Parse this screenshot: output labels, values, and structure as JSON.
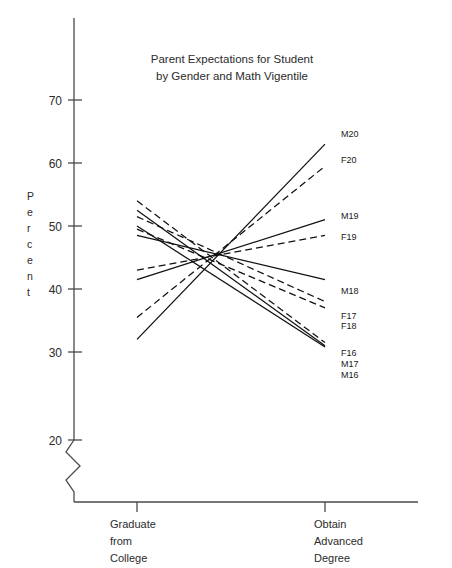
{
  "chart_data": {
    "type": "line",
    "title": "Parent Expectations for Student by Gender and Math Vigentile",
    "title_line1": "Parent Expectations for Student",
    "title_line2": "by Gender and Math Vigentile",
    "xlabel": "",
    "ylabel": "Percent",
    "categories": [
      "Graduate from College",
      "Obtain Advanced Degree"
    ],
    "category_lines": [
      [
        "Graduate",
        "from",
        "College"
      ],
      [
        "Obtain",
        "Advanced",
        "Degree"
      ]
    ],
    "ylim": [
      20,
      75
    ],
    "yticks": [
      20,
      30,
      40,
      50,
      60,
      70
    ],
    "ytick_labels": [
      "20",
      "30",
      "40",
      "50",
      "60",
      "70"
    ],
    "axis_break": true,
    "axis_break_note": "zigzag break on y-axis below 20",
    "grid": false,
    "legend": "inline labels at right end of each line",
    "series": [
      {
        "name": "M20",
        "gender": "Male",
        "vigentile": 20,
        "style": "solid",
        "values": [
          32.0,
          63.0
        ]
      },
      {
        "name": "F20",
        "gender": "Female",
        "vigentile": 20,
        "style": "dashed",
        "values": [
          35.5,
          59.5
        ]
      },
      {
        "name": "M19",
        "gender": "Male",
        "vigentile": 19,
        "style": "solid",
        "values": [
          41.5,
          51.0
        ]
      },
      {
        "name": "F19",
        "gender": "Female",
        "vigentile": 19,
        "style": "dashed",
        "values": [
          43.0,
          48.5
        ]
      },
      {
        "name": "M18",
        "gender": "Male",
        "vigentile": 18,
        "style": "solid",
        "values": [
          48.5,
          41.5
        ]
      },
      {
        "name": "F17",
        "gender": "Female",
        "vigentile": 17,
        "style": "dashed",
        "values": [
          51.5,
          38.0
        ]
      },
      {
        "name": "F18",
        "gender": "Female",
        "vigentile": 18,
        "style": "dashed",
        "values": [
          49.5,
          37.0
        ]
      },
      {
        "name": "F16",
        "gender": "Female",
        "vigentile": 16,
        "style": "dashed",
        "values": [
          54.0,
          31.5
        ]
      },
      {
        "name": "M17",
        "gender": "Male",
        "vigentile": 17,
        "style": "solid",
        "values": [
          52.5,
          31.0
        ]
      },
      {
        "name": "M16",
        "gender": "Male",
        "vigentile": 16,
        "style": "solid",
        "values": [
          50.0,
          30.8
        ]
      }
    ],
    "series_labels": [
      "M20",
      "F20",
      "M19",
      "F19",
      "M18",
      "F17",
      "F18",
      "F16",
      "M17",
      "M16"
    ],
    "label_positions": [
      {
        "name": "M20",
        "x": 341,
        "y": 137
      },
      {
        "name": "F20",
        "x": 341,
        "y": 163
      },
      {
        "name": "M19",
        "x": 341,
        "y": 219
      },
      {
        "name": "F19",
        "x": 341,
        "y": 240
      },
      {
        "name": "M18",
        "x": 341,
        "y": 294
      },
      {
        "name": "F17",
        "x": 341,
        "y": 319
      },
      {
        "name": "F18",
        "x": 341,
        "y": 329
      },
      {
        "name": "F16",
        "x": 341,
        "y": 356
      },
      {
        "name": "M17",
        "x": 341,
        "y": 367
      },
      {
        "name": "M16",
        "x": 341,
        "y": 378
      }
    ]
  }
}
